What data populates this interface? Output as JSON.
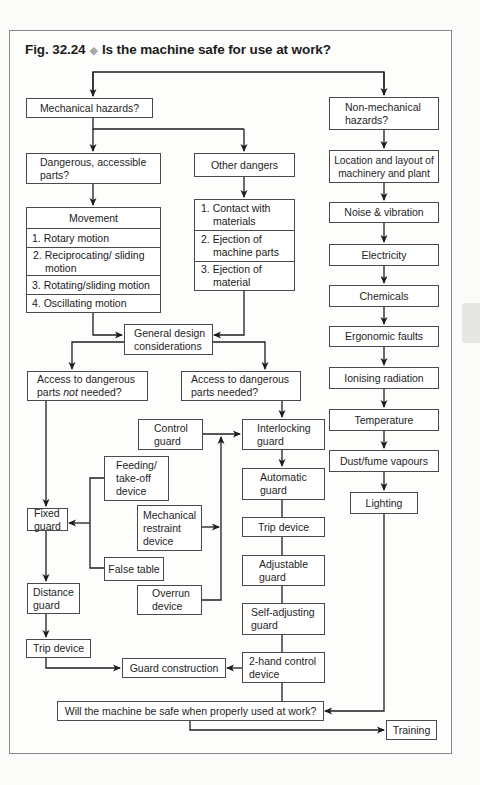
{
  "figure": {
    "number": "Fig. 32.24",
    "separator": "◆",
    "title": "Is the machine safe for use at work?"
  },
  "nodes": {
    "mechanical_hazards": "Mechanical hazards?",
    "non_mechanical_hazards": "Non-mechanical hazards?",
    "dangerous_accessible_parts": "Dangerous, accessible parts?",
    "other_dangers": "Other dangers",
    "movement": {
      "header": "Movement",
      "items": [
        "1. Rotary motion",
        "2. Reciprocating/ sliding motion",
        "3. Rotating/sliding motion",
        "4. Oscillating motion"
      ]
    },
    "other_dangers_list": [
      "1. Contact with materials",
      "2. Ejection of machine parts",
      "3. Ejection of material"
    ],
    "non_mechanical_list": [
      "Location and layout of machinery and plant",
      "Noise & vibration",
      "Electricity",
      "Chemicals",
      "Ergonomic faults",
      "Ionising radiation",
      "Temperature",
      "Dust/fume vapours",
      "Lighting"
    ],
    "general_design": "General design considerations",
    "access_not_needed": {
      "pre": "Access to dangerous parts ",
      "em": "not",
      "post": " needed?"
    },
    "access_needed": "Access to dangerous parts needed?",
    "control_guard": "Control guard",
    "interlocking_guard": "Interlocking guard",
    "feeding_takeoff": "Feeding/ take-off device",
    "fixed_guard": "Fixed guard",
    "mechanical_restraint": "Mechanical restraint device",
    "false_table": "False table",
    "distance_guard": "Distance guard",
    "overrun_device": "Overrun device",
    "automatic_guard": "Automatic guard",
    "trip_device_right": "Trip device",
    "adjustable_guard": "Adjustable guard",
    "self_adjusting_guard": "Self-adjusting guard",
    "two_hand_control": "2-hand control device",
    "trip_device_left": "Trip device",
    "guard_construction": "Guard construction",
    "safe_question": "Will the machine be safe when properly used at work?",
    "training": "Training"
  },
  "colors": {
    "line": "#1e1e1e",
    "box_border": "#4a4a4a",
    "frame_border": "#8a8a8a",
    "diamond": "#a7a7a7"
  }
}
